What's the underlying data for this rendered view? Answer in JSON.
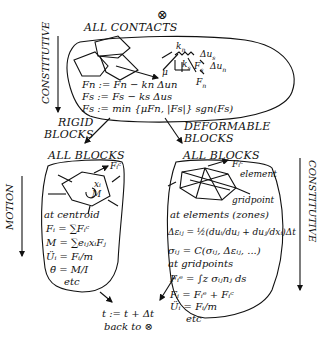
{
  "diagram": {
    "type": "flowchart",
    "start_symbol": "⊗",
    "contacts": {
      "title": "ALL CONTACTS",
      "spring_labels": [
        "k_n",
        "k_s",
        "μ",
        "F_s",
        "Δu_s",
        "Δu_n",
        "F_n"
      ],
      "equations": [
        "Fn := Fn − kn Δun",
        "Fs := Fs − ks Δus",
        "Fs := min {μFn, |Fs|} sgn(Fs)"
      ]
    },
    "branches": {
      "left_label_line1": "RIGID",
      "left_label_line2": "BLOCKS",
      "right_label_line1": "DEFORMABLE",
      "right_label_line2": "BLOCKS"
    },
    "rigid": {
      "title": "ALL BLOCKS",
      "force_label": "Fᵢᶜ",
      "centroid_labels": [
        "xᵢ",
        "M"
      ],
      "section": "at centroid",
      "equations": [
        "Fᵢ = ∑Fᵢᶜ",
        "M = ∑eᵢⱼxᵢFⱼ",
        "Üᵢ = Fᵢ/m",
        "θ̈ = M/I",
        "etc"
      ]
    },
    "deformable": {
      "title": "ALL BLOCKS",
      "force_label": "Fᵢᶜ",
      "element_label": "element",
      "gridpoint_label": "gridpoint",
      "section1": "at elements (zones)",
      "strain_eq": "Δεᵢⱼ = ½(duᵢ/duⱼ + duⱼ/dxᵢ)Δt",
      "stress_eq": "σᵢⱼ = C(σᵢⱼ, Δεᵢⱼ, ...)",
      "section2": "at gridpoints",
      "equations": [
        "Fᵢᵉ = ∫z σᵢⱼnⱼ ds",
        "Fᵢ = Fᵢᵉ + Fᵢᶜ",
        "Üᵢ = Fᵢ/m",
        "etc"
      ]
    },
    "timestep": {
      "line1": "t := t + Δt",
      "line2": "back to ⊗"
    },
    "side_labels": {
      "top_left": "CONSTITUTIVE",
      "left": "MOTION",
      "right": "CONSTITUTIVE"
    }
  }
}
